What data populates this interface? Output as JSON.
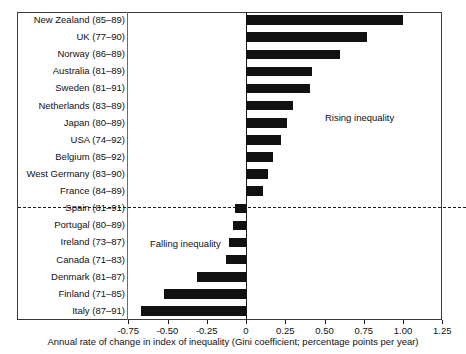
{
  "figure": {
    "top_cropped_text": "",
    "annotations": {
      "rising": "Rising inequality",
      "falling": "Falling inequality"
    }
  },
  "chart_data": {
    "type": "bar",
    "orientation": "horizontal",
    "title": "",
    "xlabel": "Annual rate of change in index of inequality (Gini coefficient; percentage points per year)",
    "ylabel": "",
    "xlim": [
      -0.875,
      1.25
    ],
    "xticks": [
      -0.75,
      -0.5,
      -0.25,
      0,
      0.25,
      0.5,
      0.75,
      1.0,
      1.25
    ],
    "xtick_labels": [
      "-0.75",
      "-0.50",
      "-0.25",
      "0",
      "0.25",
      "0.50",
      "0.75",
      "1.00",
      "1.25"
    ],
    "grid": false,
    "legend": "none",
    "bar_color": "#111111",
    "zero_reference_line": 0,
    "divider_after_category": "France (84–89)",
    "categories": [
      "New Zealand (85–89)",
      "UK (77–90)",
      "Norway (86–89)",
      "Australia (81–89)",
      "Sweden (81–91)",
      "Netherlands (83–89)",
      "Japan (80–89)",
      "USA (74–92)",
      "Belgium (85–92)",
      "West Germany (83–90)",
      "France (84–89)",
      "Spain (81–91)",
      "Portugal (80–89)",
      "Ireland (73–87)",
      "Canada (71–83)",
      "Denmark (81–87)",
      "Finland (71–85)",
      "Italy (87–91)"
    ],
    "values": [
      1.0,
      0.77,
      0.6,
      0.42,
      0.41,
      0.3,
      0.26,
      0.22,
      0.17,
      0.14,
      0.11,
      -0.07,
      -0.08,
      -0.11,
      -0.13,
      -0.31,
      -0.52,
      -0.67
    ]
  }
}
